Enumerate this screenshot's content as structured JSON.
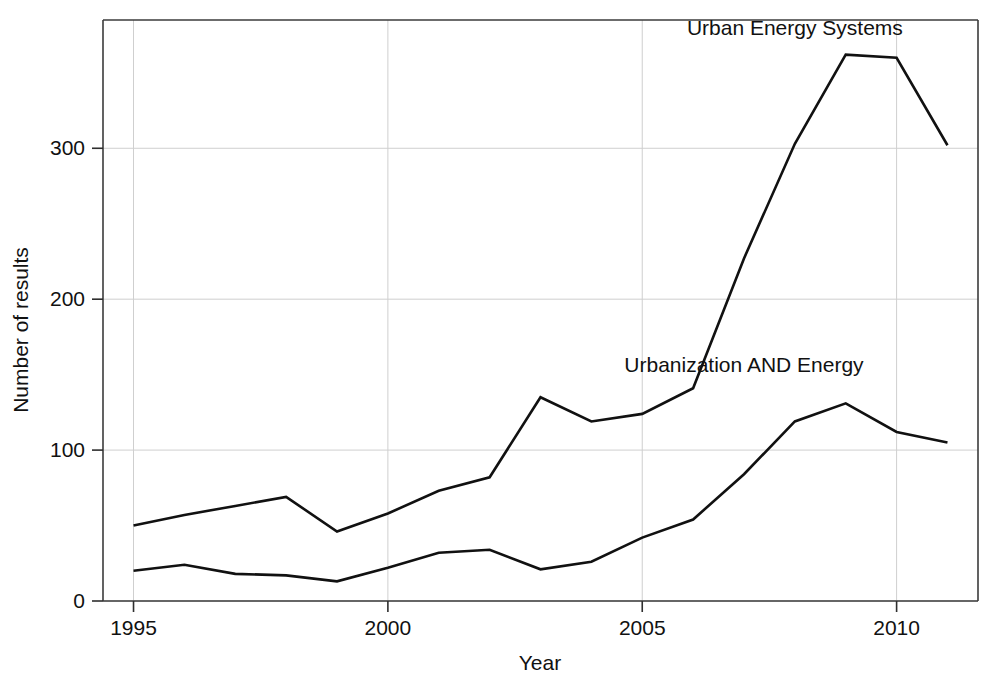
{
  "chart_data": {
    "type": "line",
    "title": "",
    "xlabel": "Year",
    "ylabel": "Number of results",
    "x": [
      1995,
      1996,
      1997,
      1998,
      1999,
      2000,
      2001,
      2002,
      2003,
      2004,
      2005,
      2006,
      2007,
      2008,
      2009,
      2010,
      2011
    ],
    "xlim": [
      1994.4,
      2011.6
    ],
    "ylim": [
      0,
      385
    ],
    "xticks": [
      1995,
      2000,
      2005,
      2010
    ],
    "xtick_labels": [
      "1995",
      "2000",
      "2005",
      "2010"
    ],
    "yticks": [
      0,
      100,
      200,
      300
    ],
    "ytick_labels": [
      "0",
      "100",
      "200",
      "300"
    ],
    "grid": true,
    "grid_color": "#cfcfcf",
    "legend_position": "inline-annotation",
    "line_color": "#111111",
    "series": [
      {
        "name": "Urban Energy Systems",
        "label_x": 2008.0,
        "label_y": 375,
        "values": [
          50,
          57,
          63,
          69,
          46,
          58,
          73,
          82,
          135,
          119,
          124,
          141,
          227,
          303,
          362,
          360,
          302
        ]
      },
      {
        "name": "Urbanization AND Energy",
        "label_x": 2007.0,
        "label_y": 152,
        "values": [
          20,
          24,
          18,
          17,
          13,
          22,
          32,
          34,
          21,
          26,
          42,
          54,
          84,
          119,
          131,
          112,
          105
        ]
      }
    ]
  },
  "axes": {
    "x_title": "Year",
    "y_title": "Number of results"
  }
}
